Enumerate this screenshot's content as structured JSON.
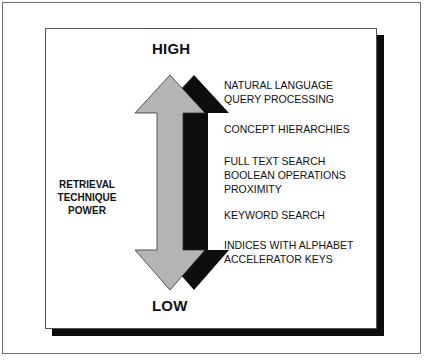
{
  "diagram": {
    "top_label": "HIGH",
    "bottom_label": "LOW",
    "axis_label_lines": [
      "RETRIEVAL",
      "TECHNIQUE",
      "POWER"
    ],
    "items": [
      {
        "lines": [
          "NATURAL LANGUAGE",
          "QUERY PROCESSING"
        ]
      },
      {
        "lines": [
          "CONCEPT HIERARCHIES"
        ]
      },
      {
        "lines": [
          "FULL TEXT SEARCH",
          "BOOLEAN OPERATIONS",
          "PROXIMITY"
        ]
      },
      {
        "lines": [
          "KEYWORD SEARCH"
        ]
      },
      {
        "lines": [
          "INDICES WITH ALPHABET",
          "ACCELERATOR KEYS"
        ]
      }
    ],
    "colors": {
      "arrow_fill": "#b4b4b4",
      "arrow_shadow": "#0d0d0d",
      "frame_border": "#6e6e6e",
      "box_shadow": "#0d0d0d"
    }
  }
}
